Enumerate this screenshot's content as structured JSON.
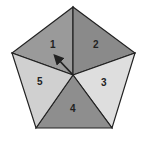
{
  "diagram": {
    "type": "pentagon-spinner",
    "sections": [
      {
        "label": "1",
        "color": "#9a9a9a"
      },
      {
        "label": "2",
        "color": "#8a8a8a"
      },
      {
        "label": "3",
        "color": "#dedede"
      },
      {
        "label": "4",
        "color": "#8e8e8e"
      },
      {
        "label": "5",
        "color": "#d0d0d0"
      }
    ],
    "outline_color": "#222222",
    "arrow": {
      "points_to": "1",
      "color": "#222222"
    }
  }
}
